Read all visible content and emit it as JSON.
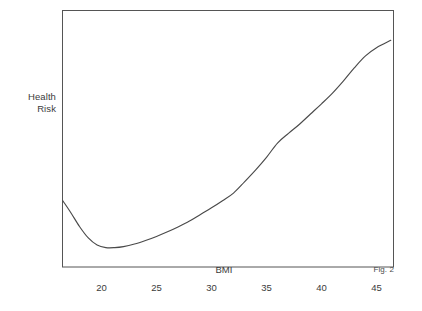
{
  "figure": {
    "caption": "Fig. 2",
    "background_color": "#ffffff",
    "line_color": "#4a4a4a",
    "frame_color": "#555555"
  },
  "chart_data": {
    "type": "line",
    "title": "",
    "subtitle": "",
    "xlabel": "BMI",
    "ylabel": "Health Risk",
    "ylabel_lines": [
      "Health",
      "Risk"
    ],
    "grid": false,
    "legend": null,
    "legend_position": "none",
    "annotations": [
      "Fig. 2"
    ],
    "xlim": [
      16.5,
      46.5
    ],
    "ylim": [
      0,
      100
    ],
    "xticks": [
      20,
      25,
      30,
      35,
      40,
      45
    ],
    "xtick_labels": [
      "20",
      "25",
      "30",
      "35",
      "40",
      "45"
    ],
    "yticks": [],
    "ytick_labels": [],
    "series": [
      {
        "name": "Health Risk vs BMI",
        "x": [
          16.5,
          17.2,
          18.0,
          18.8,
          19.6,
          20.4,
          21.2,
          22.0,
          23.0,
          24.0,
          25.0,
          26.0,
          27.0,
          28.0,
          29.0,
          30.0,
          31.0,
          32.0,
          33.0,
          34.0,
          35.0,
          36.0,
          37.0,
          38.0,
          39.0,
          40.0,
          41.0,
          42.0,
          43.0,
          44.0,
          45.0,
          46.3
        ],
        "y": [
          25.5,
          21.0,
          15.5,
          11.0,
          8.2,
          7.2,
          7.2,
          7.6,
          8.6,
          10.0,
          11.6,
          13.4,
          15.4,
          17.6,
          20.2,
          22.8,
          25.6,
          28.6,
          33.0,
          37.6,
          42.6,
          48.2,
          52.0,
          55.6,
          59.6,
          63.6,
          67.8,
          72.6,
          77.8,
          82.4,
          85.6,
          88.5
        ]
      }
    ]
  }
}
